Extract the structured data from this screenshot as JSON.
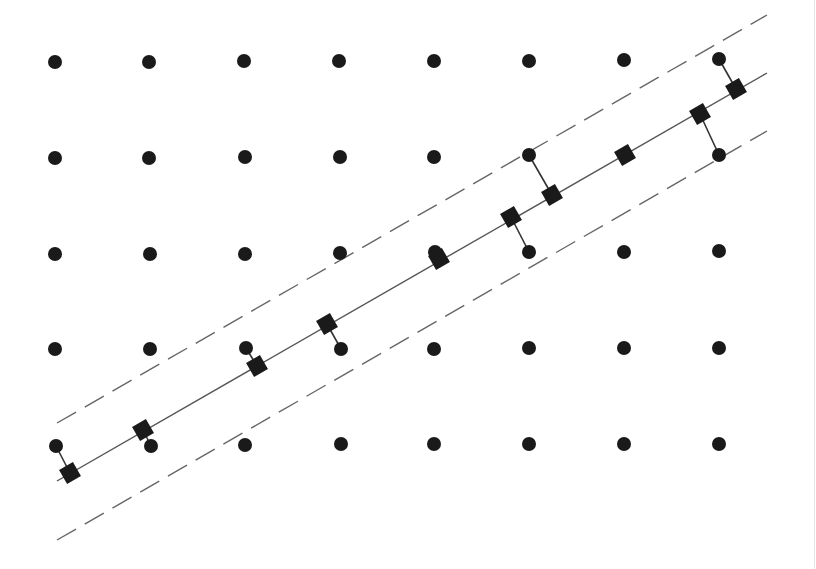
{
  "diagram": {
    "colors": {
      "point": "#1a1a1a",
      "line": "#555555",
      "dashed": "#666666",
      "projection": "#333333",
      "background": "#ffffff"
    },
    "lattice_points": [
      [
        55,
        62
      ],
      [
        149,
        62
      ],
      [
        244,
        61
      ],
      [
        339,
        61
      ],
      [
        434,
        61
      ],
      [
        529,
        61
      ],
      [
        624,
        60
      ],
      [
        719,
        59
      ],
      [
        55,
        158
      ],
      [
        149,
        158
      ],
      [
        245,
        157
      ],
      [
        340,
        157
      ],
      [
        434,
        157
      ],
      [
        529,
        155
      ],
      [
        719,
        155
      ],
      [
        55,
        254
      ],
      [
        150,
        254
      ],
      [
        245,
        254
      ],
      [
        340,
        253
      ],
      [
        435,
        252
      ],
      [
        529,
        252
      ],
      [
        624,
        252
      ],
      [
        719,
        251
      ],
      [
        55,
        349
      ],
      [
        150,
        349
      ],
      [
        246,
        348
      ],
      [
        341,
        349
      ],
      [
        434,
        349
      ],
      [
        529,
        348
      ],
      [
        624,
        348
      ],
      [
        719,
        348
      ],
      [
        56,
        446
      ],
      [
        151,
        446
      ],
      [
        245,
        445
      ],
      [
        341,
        444
      ],
      [
        434,
        444
      ],
      [
        529,
        444
      ],
      [
        624,
        444
      ],
      [
        719,
        444
      ]
    ],
    "solid_line": {
      "x1": 57,
      "y1": 481,
      "x2": 767,
      "y2": 73
    },
    "dashed_upper": {
      "x1": 57,
      "y1": 423,
      "x2": 767,
      "y2": 15
    },
    "dashed_lower": {
      "x1": 57,
      "y1": 540,
      "x2": 767,
      "y2": 131
    },
    "dash_pattern": "22,10",
    "projections": [
      {
        "point": [
          56,
          446
        ],
        "square": [
          70,
          473
        ]
      },
      {
        "point": [
          151,
          446
        ],
        "square": [
          143,
          430
        ]
      },
      {
        "point": [
          246,
          348
        ],
        "square": [
          257,
          366
        ]
      },
      {
        "point": [
          341,
          349
        ],
        "square": [
          327,
          324
        ]
      },
      {
        "point": [
          435,
          252
        ],
        "square": [
          439,
          259
        ]
      },
      {
        "point": [
          529,
          252
        ],
        "square": [
          511,
          217
        ]
      },
      {
        "point": [
          529,
          155
        ],
        "square": [
          552,
          195
        ]
      },
      {
        "point": [
          624,
          155
        ],
        "square": [
          625,
          155
        ]
      },
      {
        "point": [
          719,
          155
        ],
        "square": [
          700,
          114
        ]
      },
      {
        "point": [
          719,
          59
        ],
        "square": [
          736,
          89
        ]
      }
    ],
    "square_size": 16,
    "point_radius": 7,
    "rotation_deg": -30
  }
}
